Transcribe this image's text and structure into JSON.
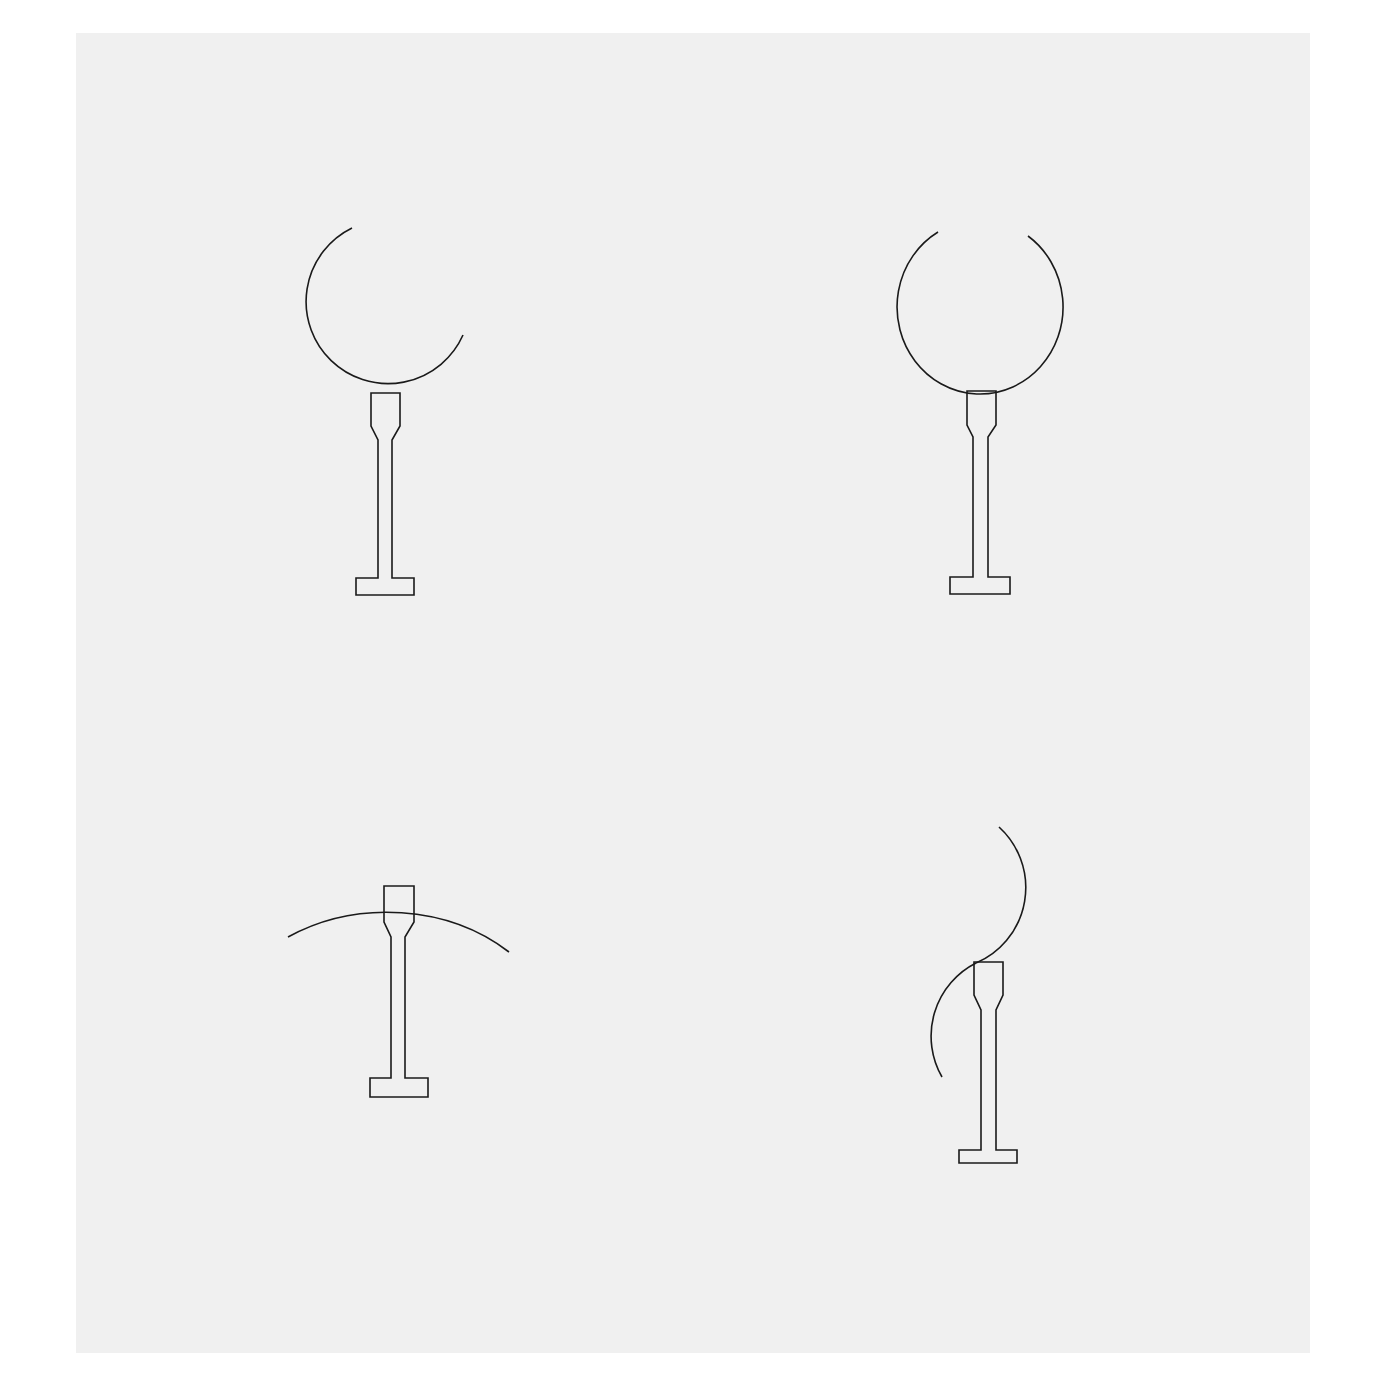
{
  "diagram": {
    "type": "line-drawing",
    "background_color": "#f0f0f0",
    "stroke_color": "#1a1a1a",
    "figures": [
      {
        "id": "fig-1",
        "position": "top-left",
        "arc": "open circle, gap at upper-right",
        "arc_relation": "arc tangent to top of stem"
      },
      {
        "id": "fig-2",
        "position": "top-right",
        "arc": "open circle, gap at top",
        "arc_relation": "arc tangent to top of stem"
      },
      {
        "id": "fig-3",
        "position": "bottom-left",
        "arc": "shallow arc over stem",
        "arc_relation": "arc tangent to top of stem"
      },
      {
        "id": "fig-4",
        "position": "bottom-right",
        "arc": "S-like arc crossing stem top",
        "arc_relation": "arc passes through top of stem"
      }
    ]
  }
}
